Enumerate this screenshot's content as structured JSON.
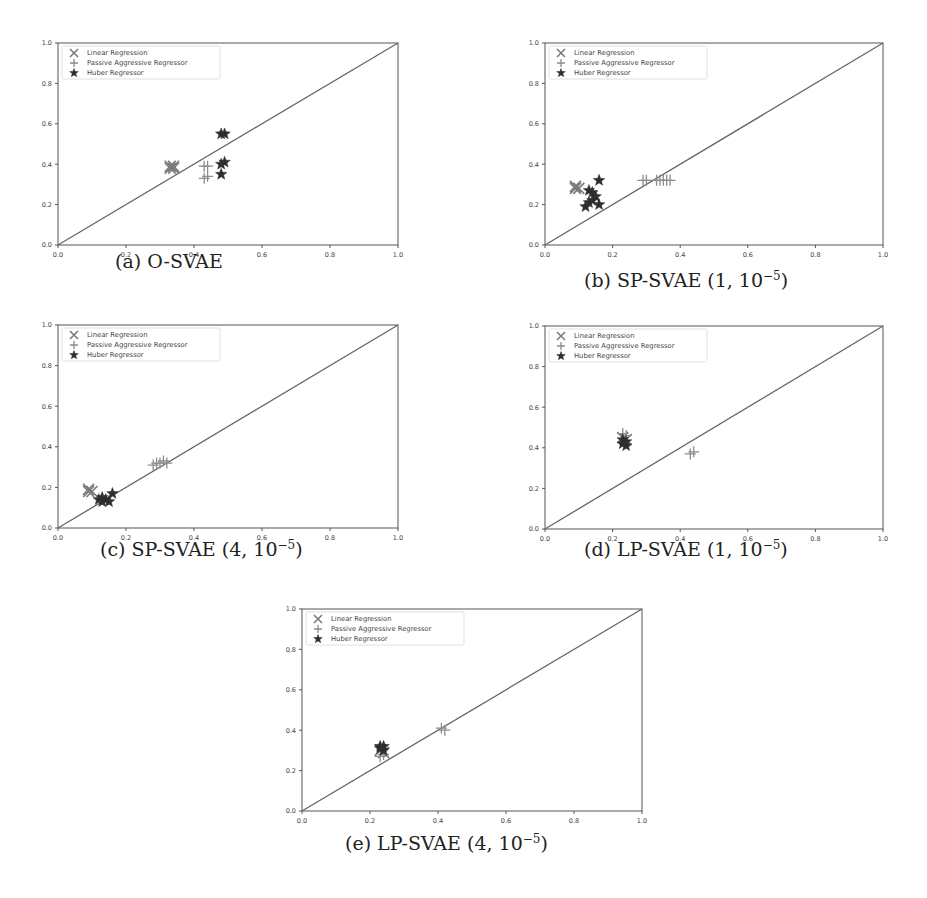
{
  "figure": {
    "legend": [
      "Linear Regression",
      "Passive Aggressive Regressor",
      "Huber Regressor"
    ],
    "tick_labels": [
      "0.0",
      "0.2",
      "0.4",
      "0.6",
      "0.8",
      "1.0"
    ],
    "colors": {
      "axis": "#555555",
      "diagonal": "#666666",
      "linear_regression": "#7a7a7a",
      "passive_aggressive": "#8c8c8c",
      "huber": "#2e2e2e"
    }
  },
  "panels": [
    {
      "id": "a",
      "caption_prefix": "(a) O-SVAE",
      "caption_exp": "",
      "caption_suffix": ""
    },
    {
      "id": "b",
      "caption_prefix": "(b) SP-SVAE (1, 10",
      "caption_exp": "−5",
      "caption_suffix": ")"
    },
    {
      "id": "c",
      "caption_prefix": "(c) SP-SVAE (4, 10",
      "caption_exp": "−5",
      "caption_suffix": ")"
    },
    {
      "id": "d",
      "caption_prefix": "(d) LP-SVAE (1, 10",
      "caption_exp": "−5",
      "caption_suffix": ")"
    },
    {
      "id": "e",
      "caption_prefix": "(e) LP-SVAE (4, 10",
      "caption_exp": "−5",
      "caption_suffix": ")"
    }
  ],
  "chart_data": [
    {
      "type": "scatter",
      "title": "(a) O-SVAE",
      "xlabel": "",
      "ylabel": "",
      "xlim": [
        0,
        1
      ],
      "ylim": [
        0,
        1
      ],
      "xticks": [
        0.0,
        0.2,
        0.4,
        0.6,
        0.8,
        1.0
      ],
      "yticks": [
        0.0,
        0.2,
        0.4,
        0.6,
        0.8,
        1.0
      ],
      "grid": false,
      "legend_position": "upper left",
      "reference_line": {
        "x": [
          0,
          1
        ],
        "y": [
          0,
          1
        ]
      },
      "series": [
        {
          "name": "Linear Regression",
          "marker": "x",
          "points": [
            [
              0.33,
              0.39
            ],
            [
              0.34,
              0.38
            ],
            [
              0.33,
              0.38
            ],
            [
              0.34,
              0.39
            ]
          ]
        },
        {
          "name": "Passive Aggressive Regressor",
          "marker": "+",
          "points": [
            [
              0.43,
              0.39
            ],
            [
              0.44,
              0.39
            ],
            [
              0.43,
              0.33
            ],
            [
              0.44,
              0.34
            ]
          ]
        },
        {
          "name": "Huber Regressor",
          "marker": "*",
          "points": [
            [
              0.48,
              0.55
            ],
            [
              0.49,
              0.55
            ],
            [
              0.48,
              0.4
            ],
            [
              0.49,
              0.41
            ],
            [
              0.48,
              0.35
            ]
          ]
        }
      ]
    },
    {
      "type": "scatter",
      "title": "(b) SP-SVAE (1, 10^-5)",
      "xlabel": "",
      "ylabel": "",
      "xlim": [
        0,
        1
      ],
      "ylim": [
        0,
        1
      ],
      "xticks": [
        0.0,
        0.2,
        0.4,
        0.6,
        0.8,
        1.0
      ],
      "yticks": [
        0.0,
        0.2,
        0.4,
        0.6,
        0.8,
        1.0
      ],
      "grid": false,
      "legend_position": "upper left",
      "reference_line": {
        "x": [
          0,
          1
        ],
        "y": [
          0,
          1
        ]
      },
      "series": [
        {
          "name": "Linear Regression",
          "marker": "x",
          "points": [
            [
              0.09,
              0.29
            ],
            [
              0.1,
              0.28
            ],
            [
              0.09,
              0.28
            ]
          ]
        },
        {
          "name": "Passive Aggressive Regressor",
          "marker": "+",
          "points": [
            [
              0.29,
              0.32
            ],
            [
              0.3,
              0.32
            ],
            [
              0.33,
              0.32
            ],
            [
              0.34,
              0.32
            ],
            [
              0.35,
              0.32
            ],
            [
              0.36,
              0.32
            ],
            [
              0.37,
              0.32
            ]
          ]
        },
        {
          "name": "Huber Regressor",
          "marker": "*",
          "points": [
            [
              0.16,
              0.32
            ],
            [
              0.13,
              0.27
            ],
            [
              0.14,
              0.26
            ],
            [
              0.15,
              0.24
            ],
            [
              0.14,
              0.22
            ],
            [
              0.12,
              0.19
            ],
            [
              0.16,
              0.2
            ],
            [
              0.13,
              0.21
            ]
          ]
        }
      ]
    },
    {
      "type": "scatter",
      "title": "(c) SP-SVAE (4, 10^-5)",
      "xlabel": "",
      "ylabel": "",
      "xlim": [
        0,
        1
      ],
      "ylim": [
        0,
        1
      ],
      "xticks": [
        0.0,
        0.2,
        0.4,
        0.6,
        0.8,
        1.0
      ],
      "yticks": [
        0.0,
        0.2,
        0.4,
        0.6,
        0.8,
        1.0
      ],
      "grid": false,
      "legend_position": "upper left",
      "reference_line": {
        "x": [
          0,
          1
        ],
        "y": [
          0,
          1
        ]
      },
      "series": [
        {
          "name": "Linear Regression",
          "marker": "x",
          "points": [
            [
              0.09,
              0.19
            ],
            [
              0.1,
              0.18
            ],
            [
              0.09,
              0.18
            ]
          ]
        },
        {
          "name": "Passive Aggressive Regressor",
          "marker": "+",
          "points": [
            [
              0.28,
              0.31
            ],
            [
              0.29,
              0.32
            ],
            [
              0.3,
              0.32
            ],
            [
              0.31,
              0.33
            ],
            [
              0.32,
              0.32
            ]
          ]
        },
        {
          "name": "Huber Regressor",
          "marker": "*",
          "points": [
            [
              0.13,
              0.15
            ],
            [
              0.14,
              0.14
            ],
            [
              0.15,
              0.13
            ],
            [
              0.13,
              0.13
            ],
            [
              0.16,
              0.17
            ],
            [
              0.12,
              0.14
            ]
          ]
        }
      ]
    },
    {
      "type": "scatter",
      "title": "(d) LP-SVAE (1, 10^-5)",
      "xlabel": "",
      "ylabel": "",
      "xlim": [
        0,
        1
      ],
      "ylim": [
        0,
        1
      ],
      "xticks": [
        0.0,
        0.2,
        0.4,
        0.6,
        0.8,
        1.0
      ],
      "yticks": [
        0.0,
        0.2,
        0.4,
        0.6,
        0.8,
        1.0
      ],
      "grid": false,
      "legend_position": "upper left",
      "reference_line": {
        "x": [
          0,
          1
        ],
        "y": [
          0,
          1
        ]
      },
      "series": [
        {
          "name": "Linear Regression",
          "marker": "x",
          "points": [
            [
              0.23,
              0.45
            ],
            [
              0.24,
              0.44
            ]
          ]
        },
        {
          "name": "Passive Aggressive Regressor",
          "marker": "+",
          "points": [
            [
              0.23,
              0.47
            ],
            [
              0.24,
              0.46
            ],
            [
              0.43,
              0.37
            ],
            [
              0.44,
              0.38
            ]
          ]
        },
        {
          "name": "Huber Regressor",
          "marker": "*",
          "points": [
            [
              0.23,
              0.42
            ],
            [
              0.24,
              0.43
            ],
            [
              0.24,
              0.41
            ],
            [
              0.23,
              0.44
            ]
          ]
        }
      ]
    },
    {
      "type": "scatter",
      "title": "(e) LP-SVAE (4, 10^-5)",
      "xlabel": "",
      "ylabel": "",
      "xlim": [
        0,
        1
      ],
      "ylim": [
        0,
        1
      ],
      "xticks": [
        0.0,
        0.2,
        0.4,
        0.6,
        0.8,
        1.0
      ],
      "yticks": [
        0.0,
        0.2,
        0.4,
        0.6,
        0.8,
        1.0
      ],
      "grid": false,
      "legend_position": "upper left",
      "reference_line": {
        "x": [
          0,
          1
        ],
        "y": [
          0,
          1
        ]
      },
      "series": [
        {
          "name": "Linear Regression",
          "marker": "x",
          "points": [
            [
              0.23,
              0.3
            ],
            [
              0.24,
              0.29
            ]
          ]
        },
        {
          "name": "Passive Aggressive Regressor",
          "marker": "+",
          "points": [
            [
              0.23,
              0.27
            ],
            [
              0.24,
              0.28
            ],
            [
              0.41,
              0.41
            ],
            [
              0.42,
              0.4
            ]
          ]
        },
        {
          "name": "Huber Regressor",
          "marker": "*",
          "points": [
            [
              0.23,
              0.31
            ],
            [
              0.24,
              0.32
            ],
            [
              0.24,
              0.3
            ],
            [
              0.23,
              0.32
            ]
          ]
        }
      ]
    }
  ]
}
